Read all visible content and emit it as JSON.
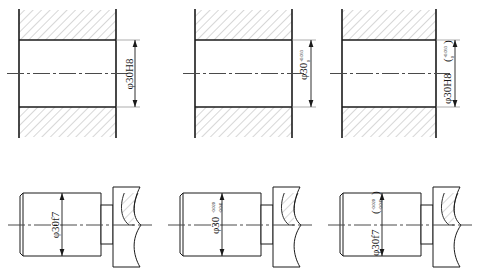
{
  "drawing": {
    "title": "Dimensioning of a 30 mm H8/f7 clearance fit",
    "sheet_width": 480,
    "sheet_height": 277,
    "background_color": "#ffffff",
    "line_color": "#1a1a1a",
    "hatch_color": "#9a9a9a",
    "centerline_color": "#4a4a4a",
    "nominal_size": "30",
    "diameter_symbol": "φ",
    "rows": [
      {
        "name": "hole-row",
        "view_type": "section",
        "description": "Hole shown as a hatched sectional view"
      },
      {
        "name": "shaft-row",
        "view_type": "outside-view",
        "description": "Shaft shown as an outside view with broken-out flange"
      }
    ],
    "columns": [
      {
        "name": "tolerance-code-only",
        "style": "Tolerance class symbol only"
      },
      {
        "name": "deviations-only",
        "style": "Numeric limit deviations only"
      },
      {
        "name": "code-with-deviations",
        "style": "Symbol followed by deviations in parentheses"
      }
    ],
    "views": [
      {
        "id": "hole-code",
        "kind": "hole",
        "label_main": "φ30H8",
        "upper_deviation": "",
        "lower_deviation": "",
        "parenthesis": false,
        "label_full": "φ30H8"
      },
      {
        "id": "hole-deviations",
        "kind": "hole",
        "label_main": "φ30",
        "upper_deviation": "+0.033",
        "lower_deviation": "0",
        "parenthesis": false,
        "label_full": "φ30 +0.033 / 0"
      },
      {
        "id": "hole-code-deviations",
        "kind": "hole",
        "label_main": "φ30H8",
        "upper_deviation": "+0.033",
        "lower_deviation": "0",
        "parenthesis": true,
        "label_full": "φ30H8( +0.033 / 0 )"
      },
      {
        "id": "shaft-code",
        "kind": "shaft",
        "label_main": "φ30f7",
        "upper_deviation": "",
        "lower_deviation": "",
        "parenthesis": false,
        "label_full": "φ30f7"
      },
      {
        "id": "shaft-deviations",
        "kind": "shaft",
        "label_main": "φ30",
        "upper_deviation": "-0.020",
        "lower_deviation": "-0.041",
        "parenthesis": false,
        "label_full": "φ30 -0.020 / -0.041"
      },
      {
        "id": "shaft-code-deviations",
        "kind": "shaft",
        "label_main": "φ30f7",
        "upper_deviation": "-0.020",
        "lower_deviation": "-0.041",
        "parenthesis": true,
        "label_full": "φ30f7( -0.020 / -0.041 )"
      }
    ]
  }
}
